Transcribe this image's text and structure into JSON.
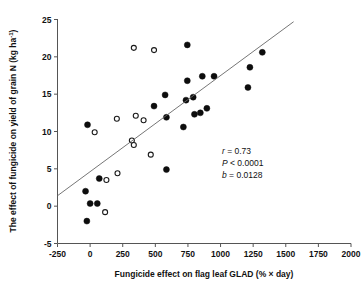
{
  "chart_data": {
    "type": "scatter",
    "title": "",
    "xlabel": "Fungicide effect on flag leaf GLAD (% × day)",
    "ylabel": "The effect of fungicide on yield of grain N (kg ha",
    "ylabel_sup": "-1",
    "ylabel_close": ")",
    "xlim": [
      -250,
      2000
    ],
    "ylim": [
      -5,
      25
    ],
    "xticks": [
      -250,
      0,
      250,
      500,
      750,
      1000,
      1250,
      1500,
      1750,
      2000
    ],
    "xtick_labels": [
      "-250",
      "0",
      "250",
      "500",
      "750",
      "1000",
      "1250",
      "1500",
      "1750",
      "2000"
    ],
    "yticks": [
      -5,
      0,
      5,
      10,
      15,
      20,
      25
    ],
    "ytick_labels": [
      "-5",
      "0",
      "5",
      "10",
      "15",
      "20",
      "25"
    ],
    "grid": false,
    "legend": "none",
    "series": [
      {
        "name": "filled-markers",
        "marker": "filled-circle",
        "color": "#0d0d0d",
        "points": [
          [
            -35,
            2.0
          ],
          [
            -25,
            -2.0
          ],
          [
            -20,
            10.9
          ],
          [
            0,
            0.35
          ],
          [
            55,
            0.35
          ],
          [
            70,
            3.7
          ],
          [
            585,
            4.9
          ],
          [
            585,
            11.9
          ],
          [
            490,
            13.4
          ],
          [
            575,
            14.9
          ],
          [
            715,
            10.6
          ],
          [
            735,
            14.2
          ],
          [
            745,
            16.8
          ],
          [
            745,
            21.6
          ],
          [
            790,
            14.6
          ],
          [
            800,
            12.3
          ],
          [
            845,
            12.5
          ],
          [
            860,
            17.4
          ],
          [
            895,
            13.1
          ],
          [
            950,
            17.4
          ],
          [
            1210,
            15.9
          ],
          [
            1225,
            18.6
          ],
          [
            1320,
            20.6
          ]
        ]
      },
      {
        "name": "open-markers",
        "marker": "open-circle",
        "color": "#ffffff",
        "points": [
          [
            115,
            -0.8
          ],
          [
            125,
            3.5
          ],
          [
            210,
            4.4
          ],
          [
            205,
            11.7
          ],
          [
            320,
            8.8
          ],
          [
            335,
            8.2
          ],
          [
            335,
            21.2
          ],
          [
            350,
            12.1
          ],
          [
            410,
            11.5
          ],
          [
            465,
            6.9
          ],
          [
            490,
            20.9
          ],
          [
            35,
            9.9
          ]
        ]
      }
    ],
    "fit_line": {
      "name": "regression-line",
      "slope": 0.0128,
      "x_start": -250,
      "y_start": 1.4,
      "x_end": 1560,
      "y_end": 24.7,
      "color": "#666666"
    },
    "annotations": [
      {
        "symbol": "r",
        "relation": " = ",
        "value": "0.73"
      },
      {
        "symbol": "P",
        "relation": " < ",
        "value": "0.0001"
      },
      {
        "symbol": "b",
        "relation": " = ",
        "value": "0.0128"
      }
    ]
  }
}
